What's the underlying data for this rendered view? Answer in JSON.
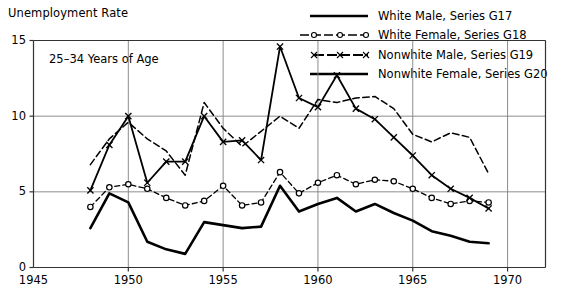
{
  "axis_title": "Unemployment Rate",
  "annotation": "25–34 Years of Age",
  "legend": {
    "entries": [
      {
        "label": "White Male, Series G17",
        "key": "solid-thick-line"
      },
      {
        "label": "White Female, Series G18",
        "key": "dashed-line-circle-markers"
      },
      {
        "label": "Nonwhite Male, Series G19",
        "key": "dashed-line-x-markers"
      },
      {
        "label": "Nonwhite Female, Series G20",
        "key": "solid-thick-line"
      }
    ]
  },
  "colors": {
    "ink": "#000000",
    "grid": "#808080",
    "background": "#ffffff"
  },
  "chart_data": {
    "type": "line",
    "title": "Unemployment Rate",
    "subtitle": "25–34 Years of Age",
    "xlabel": "",
    "ylabel": "Unemployment Rate",
    "xlim": [
      1945,
      1972
    ],
    "ylim": [
      0,
      15
    ],
    "xticks": [
      1945,
      1950,
      1955,
      1960,
      1965,
      1970
    ],
    "yticks": [
      0,
      5,
      10,
      15
    ],
    "grid": true,
    "legend_position": "top-right",
    "x": [
      1948,
      1949,
      1950,
      1951,
      1952,
      1953,
      1954,
      1955,
      1956,
      1957,
      1958,
      1959,
      1960,
      1961,
      1962,
      1963,
      1964,
      1965,
      1966,
      1967,
      1968,
      1969
    ],
    "series": [
      {
        "name": "White Male, Series G17",
        "series_code": "G17",
        "style": "solid",
        "marker": "none",
        "width": 2.6,
        "values": [
          2.6,
          4.9,
          4.3,
          1.7,
          1.2,
          0.9,
          3.0,
          2.8,
          2.6,
          2.7,
          5.4,
          3.7,
          4.2,
          4.6,
          3.7,
          4.2,
          3.6,
          3.1,
          2.4,
          2.1,
          1.7,
          1.6
        ]
      },
      {
        "name": "White Female, Series G18",
        "series_code": "G18",
        "style": "dashed",
        "marker": "circle",
        "width": 1.3,
        "values": [
          4.0,
          5.3,
          5.5,
          5.2,
          4.6,
          4.1,
          4.4,
          5.4,
          4.1,
          4.3,
          6.3,
          4.9,
          5.6,
          6.1,
          5.5,
          5.8,
          5.7,
          5.2,
          4.6,
          4.2,
          4.4,
          4.3
        ]
      },
      {
        "name": "Nonwhite Male, Series G19",
        "series_code": "G19",
        "style": "solid",
        "marker": "x",
        "width": 1.8,
        "values": [
          5.1,
          8.1,
          10.0,
          5.6,
          7.0,
          7.0,
          10.0,
          8.3,
          8.4,
          7.1,
          14.6,
          11.2,
          10.6,
          12.7,
          10.5,
          9.8,
          8.6,
          7.4,
          6.1,
          5.2,
          4.6,
          3.9
        ]
      },
      {
        "name": "Nonwhite Female, Series G20",
        "series_code": "G20",
        "style": "dashed",
        "marker": "none",
        "width": 1.5,
        "values": [
          6.8,
          8.5,
          9.6,
          8.5,
          7.7,
          6.1,
          10.9,
          9.2,
          8.0,
          9.0,
          10.0,
          9.2,
          11.1,
          10.9,
          11.2,
          11.3,
          10.5,
          8.8,
          8.3,
          8.9,
          8.6,
          6.2
        ]
      }
    ]
  }
}
